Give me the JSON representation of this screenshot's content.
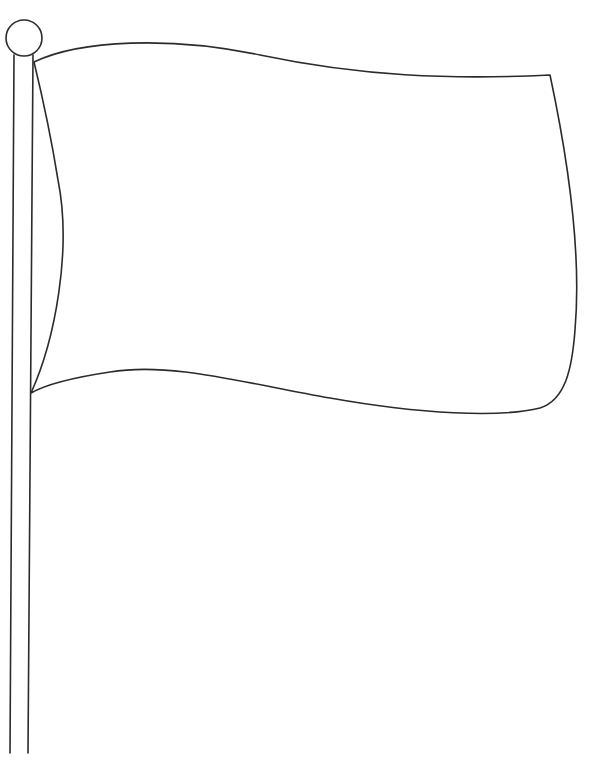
{
  "image": {
    "subject": "blank flag on a flagpole (line drawing)",
    "colors": {
      "background": "#ffffff",
      "line": "#2b2b2b",
      "flag_fill": "#ffffff"
    }
  }
}
